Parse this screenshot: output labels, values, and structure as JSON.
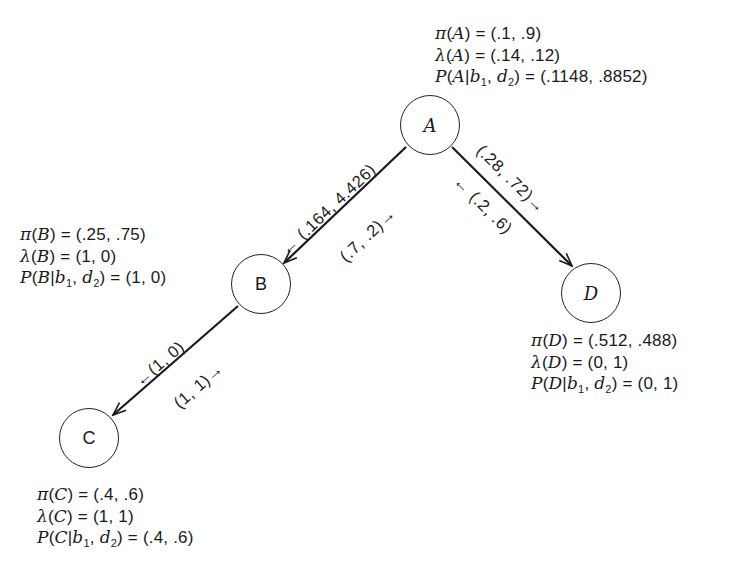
{
  "diagram": {
    "type": "bayesian-network-message-passing",
    "nodes": [
      {
        "id": "A",
        "label": "A",
        "style": "italic",
        "pi_label": "π",
        "lambda_label": "λ",
        "pi": "(.1, .9)",
        "lambda": "(.14, .12)",
        "posterior": "(.1148, .8852)"
      },
      {
        "id": "B",
        "label": "B",
        "style": "roman",
        "pi_label": "π",
        "lambda_label": "λ",
        "pi": "(.25, .75)",
        "lambda": "(1, 0)",
        "posterior": "(1, 0)"
      },
      {
        "id": "C",
        "label": "C",
        "style": "roman",
        "pi_label": "π",
        "lambda_label": "λ",
        "pi": "(.4, .6)",
        "lambda": "(1, 1)",
        "posterior": "(.4, .6)"
      },
      {
        "id": "D",
        "label": "D",
        "style": "italic",
        "pi_label": "π",
        "lambda_label": "λ",
        "pi": "(.512, .488)",
        "lambda": "(0, 1)",
        "posterior": "(0, 1)"
      }
    ],
    "evidence": {
      "b": "b",
      "b_sub": "1",
      "d": "d",
      "d_sub": "2"
    },
    "edges": [
      {
        "from": "A",
        "to": "B",
        "lambda_message": "← (.164, 4.426)",
        "pi_message": "(.7, .2)→"
      },
      {
        "from": "A",
        "to": "D",
        "pi_message": "(.28, .72)→",
        "lambda_message": "← (.2, .6)"
      },
      {
        "from": "B",
        "to": "C",
        "lambda_message": "←(1, 0)",
        "pi_message": "(1, 1)→"
      }
    ]
  }
}
